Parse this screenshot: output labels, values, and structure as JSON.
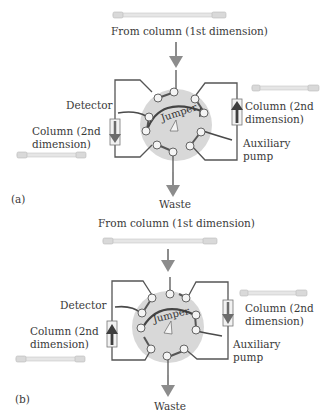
{
  "colors": {
    "arrow": "#8c8c8c",
    "line": "#555555",
    "dark_line": "#4a4a4a",
    "valve_fill": "#d8d8d8",
    "port_fill": "#f4f4f4",
    "column_arrow_dark": "#444444"
  },
  "panels": [
    {
      "id": "a",
      "panel_label": "(a)",
      "top_label": "From column (1st dimension)",
      "bottom_label": "Waste",
      "detector_label": "Detector",
      "left_column_label": "Column (2nd\ndimension)",
      "right_column_label": "Column (2nd\ndimension)",
      "pump_label": "Auxiliary\npump",
      "jumper_label": "Jumper",
      "left_column_flow": "down",
      "right_column_flow": "up"
    },
    {
      "id": "b",
      "panel_label": "(b)",
      "top_label": "From column (1st dimension)",
      "bottom_label": "Waste",
      "detector_label": "Detector",
      "left_column_label": "Column (2nd\ndimension)",
      "right_column_label": "Column (2nd\ndimension)",
      "pump_label": "Auxiliary\npump",
      "jumper_label": "Jumper",
      "left_column_flow": "up",
      "right_column_flow": "down"
    }
  ]
}
